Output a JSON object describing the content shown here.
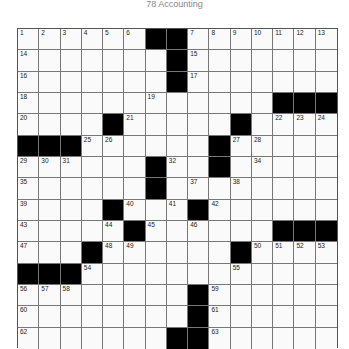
{
  "title": "78 Accounting",
  "puzzle": {
    "rows": 15,
    "cols": 15,
    "black_color": "#000000",
    "grid": [
      "......##.......",
      ".......#.......",
      ".......#.......",
      "............###",
      "....#.....#....",
      "###......#.....",
      "......#..#.....",
      "......#........",
      "....#...#......",
      ".....#......###",
      "...#......#....",
      "###............",
      "........#......",
      "........#......",
      ".......##......"
    ],
    "numbers": [
      [
        1,
        2,
        3,
        4,
        5,
        6,
        0,
        0,
        7,
        8,
        9,
        10,
        11,
        12,
        13
      ],
      [
        14,
        0,
        0,
        0,
        0,
        0,
        0,
        0,
        15,
        0,
        0,
        0,
        0,
        0,
        0
      ],
      [
        16,
        0,
        0,
        0,
        0,
        0,
        0,
        0,
        17,
        0,
        0,
        0,
        0,
        0,
        0
      ],
      [
        18,
        0,
        0,
        0,
        0,
        0,
        19,
        0,
        0,
        0,
        0,
        0,
        0,
        0,
        0
      ],
      [
        20,
        0,
        0,
        0,
        0,
        21,
        0,
        0,
        0,
        0,
        0,
        0,
        22,
        23,
        24
      ],
      [
        0,
        0,
        0,
        25,
        26,
        0,
        0,
        0,
        0,
        0,
        27,
        28,
        0,
        0,
        0
      ],
      [
        29,
        30,
        31,
        0,
        0,
        0,
        0,
        32,
        0,
        33,
        0,
        34,
        0,
        0,
        0
      ],
      [
        35,
        0,
        0,
        0,
        0,
        0,
        36,
        0,
        37,
        0,
        38,
        0,
        0,
        0,
        0
      ],
      [
        39,
        0,
        0,
        0,
        0,
        40,
        0,
        41,
        0,
        42,
        0,
        0,
        0,
        0,
        0
      ],
      [
        43,
        0,
        0,
        0,
        44,
        0,
        45,
        0,
        46,
        0,
        0,
        0,
        0,
        0,
        0
      ],
      [
        47,
        0,
        0,
        0,
        48,
        49,
        0,
        0,
        0,
        0,
        0,
        50,
        51,
        52,
        53
      ],
      [
        0,
        0,
        0,
        54,
        0,
        0,
        0,
        0,
        0,
        0,
        55,
        0,
        0,
        0,
        0
      ],
      [
        56,
        57,
        58,
        0,
        0,
        0,
        0,
        0,
        0,
        59,
        0,
        0,
        0,
        0,
        0
      ],
      [
        60,
        0,
        0,
        0,
        0,
        0,
        0,
        0,
        0,
        61,
        0,
        0,
        0,
        0,
        0
      ],
      [
        62,
        0,
        0,
        0,
        0,
        0,
        0,
        0,
        0,
        63,
        0,
        0,
        0,
        0,
        0
      ]
    ]
  }
}
